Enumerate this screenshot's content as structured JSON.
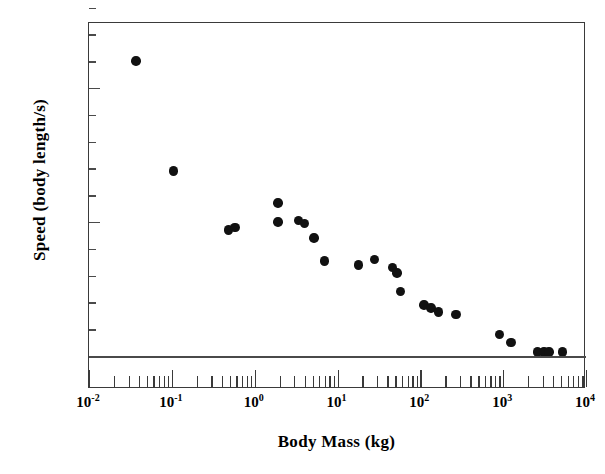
{
  "chart_data": {
    "type": "scatter",
    "title": "",
    "xlabel": "Body Mass  (kg)",
    "ylabel": "Speed  (body length/s)",
    "xscale": "log",
    "yscale": "linear",
    "xlim": [
      0.01,
      10000
    ],
    "ylim": [
      -5,
      135
    ],
    "grid": false,
    "legend": null,
    "x_tick_labels": [
      "10-2",
      "10-1",
      "100",
      "101",
      "102",
      "103",
      "104"
    ],
    "x_tick_mantissas": [
      "10",
      "10",
      "10",
      "10",
      "10",
      "10",
      "10"
    ],
    "x_tick_exponents": [
      "-2",
      "-1",
      "0",
      "1",
      "2",
      "3",
      "4"
    ],
    "x_tick_values": [
      0.01,
      0.1,
      1,
      10,
      100,
      1000,
      10000
    ],
    "y_tick_labels": [
      "0",
      "50",
      "100"
    ],
    "y_tick_values": [
      0,
      50,
      100
    ],
    "y_minor_step": 10,
    "marker": "filled-circle",
    "marker_color": "#111111",
    "marker_size_px": 9.5,
    "points": [
      {
        "x": 0.037,
        "y": 110
      },
      {
        "x": 0.105,
        "y": 69
      },
      {
        "x": 0.48,
        "y": 47
      },
      {
        "x": 0.58,
        "y": 48
      },
      {
        "x": 1.9,
        "y": 57
      },
      {
        "x": 1.9,
        "y": 50
      },
      {
        "x": 3.4,
        "y": 50.5
      },
      {
        "x": 4.0,
        "y": 49.5
      },
      {
        "x": 5.2,
        "y": 44
      },
      {
        "x": 7.0,
        "y": 35.5
      },
      {
        "x": 18,
        "y": 34
      },
      {
        "x": 28,
        "y": 36
      },
      {
        "x": 46,
        "y": 33
      },
      {
        "x": 52,
        "y": 31
      },
      {
        "x": 58,
        "y": 24
      },
      {
        "x": 110,
        "y": 19
      },
      {
        "x": 135,
        "y": 18
      },
      {
        "x": 165,
        "y": 16.5
      },
      {
        "x": 270,
        "y": 15.5
      },
      {
        "x": 900,
        "y": 8
      },
      {
        "x": 1250,
        "y": 5
      },
      {
        "x": 2600,
        "y": 1.5
      },
      {
        "x": 3100,
        "y": 1.5
      },
      {
        "x": 3600,
        "y": 1.5
      },
      {
        "x": 5200,
        "y": 1.5
      }
    ]
  },
  "axes": {
    "x_title": "Body Mass  (kg)",
    "y_title": "Speed  (body length/s)"
  },
  "colors": {
    "marker": "#111111",
    "frame": "#3a3a3a",
    "zero_line": "#4a4a4a",
    "background": "#ffffff"
  }
}
